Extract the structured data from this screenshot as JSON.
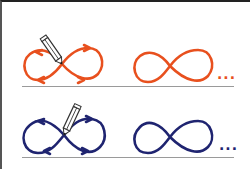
{
  "figure": {
    "rows": [
      {
        "name": "orange-row",
        "color": "#e8501e",
        "traced_icon": "infinity-with-arrows-icon",
        "tool_icon": "pencil-icon",
        "result_icon": "infinity-icon",
        "continuation": "..."
      },
      {
        "name": "navy-row",
        "color": "#1f2470",
        "traced_icon": "infinity-with-arrows-icon",
        "tool_icon": "pencil-icon",
        "result_icon": "infinity-icon",
        "continuation": "..."
      }
    ],
    "baseline_color": "#9a9a9a",
    "frame_color": "#222222"
  }
}
